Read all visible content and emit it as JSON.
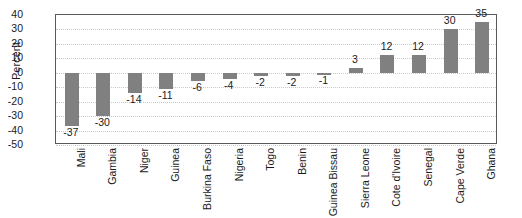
{
  "chart_data": {
    "type": "bar",
    "title": "",
    "xlabel": "",
    "ylabel": "Percent",
    "ylim": [
      -50,
      40
    ],
    "ytick_step": 10,
    "yticks": [
      40,
      30,
      20,
      10,
      0,
      -10,
      -20,
      -30,
      -40,
      -50
    ],
    "ytick_labels": [
      "40",
      "30",
      "20",
      "10",
      "0",
      "-10",
      "-20",
      "-30",
      "-40",
      "-50"
    ],
    "grid": true,
    "legend": false,
    "bar_color": "#808080",
    "categories": [
      "Mali",
      "Gambia",
      "Niger",
      "Guinea",
      "Burkina Faso",
      "Nigeria",
      "Togo",
      "Benin",
      "Guinea Bissau",
      "Sierra Leone",
      "Cote d'Ivoire",
      "Senegal",
      "Cape Verde",
      "Ghana"
    ],
    "values": [
      -37,
      -30,
      -14,
      -11,
      -6,
      -4,
      -2,
      -2,
      -1,
      3,
      12,
      12,
      30,
      35
    ],
    "data_labels": [
      "-37",
      "-30",
      "-14",
      "-11",
      "-6",
      "-4",
      "-2",
      "-2",
      "-1",
      "3",
      "12",
      "12",
      "30",
      "35"
    ]
  }
}
